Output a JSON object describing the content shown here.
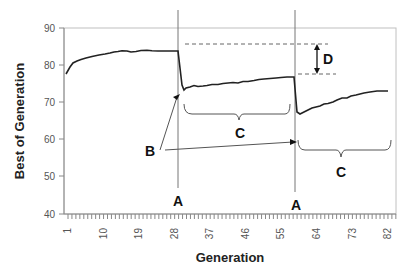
{
  "chart_data": {
    "type": "line",
    "title": "",
    "xlabel": "Generation",
    "ylabel": "Best of Generation",
    "ylim": [
      40,
      90
    ],
    "xlim": [
      1,
      84
    ],
    "y_ticks": [
      "90",
      "80",
      "70",
      "60",
      "50",
      "40"
    ],
    "x_ticks": [
      "1",
      "10",
      "19",
      "28",
      "37",
      "46",
      "55",
      "64",
      "73",
      "82"
    ],
    "grid": false,
    "legend": null,
    "series": [
      {
        "name": "Best of Generation",
        "x": [
          1,
          2,
          3,
          4,
          5,
          6,
          8,
          10,
          12,
          14,
          16,
          18,
          20,
          22,
          24,
          26,
          28,
          29,
          30,
          31,
          33,
          36,
          40,
          44,
          48,
          52,
          56,
          58,
          59,
          60,
          62,
          65,
          68,
          71,
          74,
          77,
          80,
          84
        ],
        "values": [
          80.5,
          82.5,
          83.5,
          84,
          84.3,
          84.8,
          85.2,
          85.6,
          85.5,
          85.9,
          85.8,
          85.8,
          85.7,
          85.7,
          85.6,
          85.6,
          85.6,
          85.5,
          74.5,
          75.5,
          76,
          76.2,
          76.5,
          77,
          77.2,
          77.5,
          77.6,
          77.6,
          77.6,
          60,
          61,
          62,
          63.2,
          64,
          65,
          65.5,
          66.3,
          66.5
        ]
      }
    ],
    "annotations": [
      {
        "label": "A",
        "description": "vertical line at generation ~29 (first drop)"
      },
      {
        "label": "A",
        "description": "vertical line at generation ~59 (second drop)"
      },
      {
        "label": "B",
        "description": "arrows pointing to minimum after each drop"
      },
      {
        "label": "C",
        "description": "braces spanning recovery periods after each drop"
      },
      {
        "label": "D",
        "description": "double arrow showing gap between pre-drop peak levels (~86 vs ~77.6)"
      }
    ]
  },
  "labels": {
    "A1": "A",
    "A2": "A",
    "B": "B",
    "C1": "C",
    "C2": "C",
    "D": "D"
  }
}
